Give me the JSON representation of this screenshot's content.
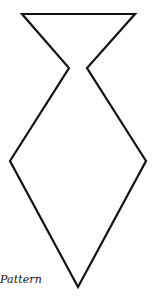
{
  "diagram": {
    "caption": "Pattern",
    "stroke_color": "#111111",
    "stroke_width": 2.2,
    "fill_color": "#ffffff",
    "viewbox": [
      155,
      296
    ],
    "outline_points": [
      [
        22,
        14
      ],
      [
        135,
        14
      ],
      [
        87,
        68
      ],
      [
        146,
        161
      ],
      [
        78,
        287
      ],
      [
        10,
        161
      ],
      [
        69,
        68
      ]
    ]
  }
}
